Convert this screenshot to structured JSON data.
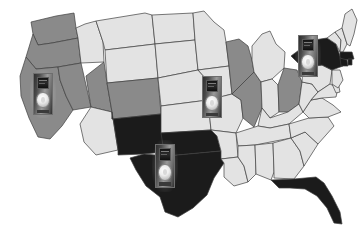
{
  "figure": {
    "name": "us-device-distribution-map",
    "background_color": "#ffffff",
    "border_color": "#3f3f3f"
  },
  "legend_colors": {
    "dark": "#1b1b1b",
    "medium": "#8a8a8a",
    "light": "#e3e3e3",
    "outline": "#3f3f3f"
  },
  "chart_data": {
    "type": "choropleth-map",
    "region": "United States (contiguous 48 states)",
    "grid": false,
    "legend_position": "none",
    "categories": [
      "dark",
      "medium",
      "light"
    ],
    "category_colors": {
      "dark": "#1b1b1b",
      "medium": "#8a8a8a",
      "light": "#e3e3e3"
    },
    "states": [
      {
        "code": "WA",
        "name": "Washington",
        "shade": "medium"
      },
      {
        "code": "OR",
        "name": "Oregon",
        "shade": "medium"
      },
      {
        "code": "CA",
        "name": "California",
        "shade": "medium"
      },
      {
        "code": "NV",
        "name": "Nevada",
        "shade": "medium"
      },
      {
        "code": "ID",
        "name": "Idaho",
        "shade": "light"
      },
      {
        "code": "MT",
        "name": "Montana",
        "shade": "light"
      },
      {
        "code": "WY",
        "name": "Wyoming",
        "shade": "light"
      },
      {
        "code": "UT",
        "name": "Utah",
        "shade": "medium"
      },
      {
        "code": "AZ",
        "name": "Arizona",
        "shade": "light"
      },
      {
        "code": "CO",
        "name": "Colorado",
        "shade": "medium"
      },
      {
        "code": "NM",
        "name": "New Mexico",
        "shade": "dark"
      },
      {
        "code": "ND",
        "name": "North Dakota",
        "shade": "light"
      },
      {
        "code": "SD",
        "name": "South Dakota",
        "shade": "light"
      },
      {
        "code": "NE",
        "name": "Nebraska",
        "shade": "light"
      },
      {
        "code": "KS",
        "name": "Kansas",
        "shade": "light"
      },
      {
        "code": "OK",
        "name": "Oklahoma",
        "shade": "dark"
      },
      {
        "code": "TX",
        "name": "Texas",
        "shade": "dark"
      },
      {
        "code": "MN",
        "name": "Minnesota",
        "shade": "light"
      },
      {
        "code": "IA",
        "name": "Iowa",
        "shade": "light"
      },
      {
        "code": "MO",
        "name": "Missouri",
        "shade": "light"
      },
      {
        "code": "AR",
        "name": "Arkansas",
        "shade": "light"
      },
      {
        "code": "LA",
        "name": "Louisiana",
        "shade": "light"
      },
      {
        "code": "WI",
        "name": "Wisconsin",
        "shade": "medium"
      },
      {
        "code": "IL",
        "name": "Illinois",
        "shade": "medium"
      },
      {
        "code": "MI",
        "name": "Michigan",
        "shade": "light"
      },
      {
        "code": "IN",
        "name": "Indiana",
        "shade": "light"
      },
      {
        "code": "OH",
        "name": "Ohio",
        "shade": "medium"
      },
      {
        "code": "KY",
        "name": "Kentucky",
        "shade": "light"
      },
      {
        "code": "TN",
        "name": "Tennessee",
        "shade": "light"
      },
      {
        "code": "MS",
        "name": "Mississippi",
        "shade": "light"
      },
      {
        "code": "AL",
        "name": "Alabama",
        "shade": "light"
      },
      {
        "code": "GA",
        "name": "Georgia",
        "shade": "light"
      },
      {
        "code": "FL",
        "name": "Florida",
        "shade": "dark"
      },
      {
        "code": "SC",
        "name": "South Carolina",
        "shade": "light"
      },
      {
        "code": "NC",
        "name": "North Carolina",
        "shade": "light"
      },
      {
        "code": "VA",
        "name": "Virginia",
        "shade": "light"
      },
      {
        "code": "WV",
        "name": "West Virginia",
        "shade": "light"
      },
      {
        "code": "PA",
        "name": "Pennsylvania",
        "shade": "light"
      },
      {
        "code": "NY",
        "name": "New York",
        "shade": "dark"
      },
      {
        "code": "VT",
        "name": "Vermont",
        "shade": "light"
      },
      {
        "code": "NH",
        "name": "New Hampshire",
        "shade": "light"
      },
      {
        "code": "ME",
        "name": "Maine",
        "shade": "light"
      },
      {
        "code": "MA",
        "name": "Massachusetts",
        "shade": "dark"
      },
      {
        "code": "CT",
        "name": "Connecticut",
        "shade": "dark"
      },
      {
        "code": "RI",
        "name": "Rhode Island",
        "shade": "dark"
      },
      {
        "code": "NJ",
        "name": "New Jersey",
        "shade": "light"
      },
      {
        "code": "DE",
        "name": "Delaware",
        "shade": "light"
      },
      {
        "code": "MD",
        "name": "Maryland",
        "shade": "light"
      }
    ],
    "markers": [
      {
        "id": "marker-west",
        "label": "media-player",
        "on_state": "CA",
        "x": 33,
        "y": 73,
        "width": 20,
        "height": 42
      },
      {
        "id": "marker-midwest",
        "label": "media-player",
        "on_state": "IL",
        "x": 202,
        "y": 76,
        "width": 20,
        "height": 42
      },
      {
        "id": "marker-south",
        "label": "media-player",
        "on_state": "TX",
        "x": 155,
        "y": 144,
        "width": 20,
        "height": 44
      },
      {
        "id": "marker-northeast",
        "label": "media-player",
        "on_state": "NY",
        "x": 298,
        "y": 35,
        "width": 20,
        "height": 42
      }
    ]
  }
}
